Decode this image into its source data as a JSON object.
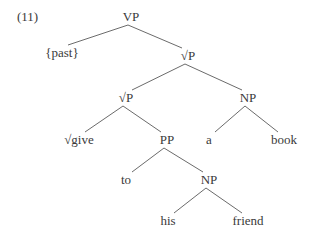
{
  "example_number": "(11)",
  "line_color": "#6b6b6b",
  "nodes": [
    {
      "id": "vp_root",
      "label": "VP",
      "x": 131,
      "y": 17
    },
    {
      "id": "past",
      "label": "{past}",
      "x": 62,
      "y": 53
    },
    {
      "id": "rootp_top",
      "label": "√P",
      "x": 188,
      "y": 56
    },
    {
      "id": "rootp_mid",
      "label": "√P",
      "x": 126,
      "y": 98
    },
    {
      "id": "np_object",
      "label": "NP",
      "x": 248,
      "y": 98
    },
    {
      "id": "give",
      "label": "√give",
      "x": 79,
      "y": 140
    },
    {
      "id": "pp",
      "label": "PP",
      "x": 167,
      "y": 140
    },
    {
      "id": "a",
      "label": "a",
      "x": 209,
      "y": 140
    },
    {
      "id": "book",
      "label": "book",
      "x": 284,
      "y": 140
    },
    {
      "id": "to",
      "label": "to",
      "x": 126,
      "y": 180
    },
    {
      "id": "np_goal",
      "label": "NP",
      "x": 209,
      "y": 180
    },
    {
      "id": "his",
      "label": "his",
      "x": 168,
      "y": 221
    },
    {
      "id": "friend",
      "label": "friend",
      "x": 248,
      "y": 221
    }
  ],
  "edges": [
    [
      "vp_root",
      "past"
    ],
    [
      "vp_root",
      "rootp_top"
    ],
    [
      "rootp_top",
      "rootp_mid"
    ],
    [
      "rootp_top",
      "np_object"
    ],
    [
      "rootp_mid",
      "give"
    ],
    [
      "rootp_mid",
      "pp"
    ],
    [
      "np_object",
      "a"
    ],
    [
      "np_object",
      "book"
    ],
    [
      "pp",
      "to"
    ],
    [
      "pp",
      "np_goal"
    ],
    [
      "np_goal",
      "his"
    ],
    [
      "np_goal",
      "friend"
    ]
  ]
}
